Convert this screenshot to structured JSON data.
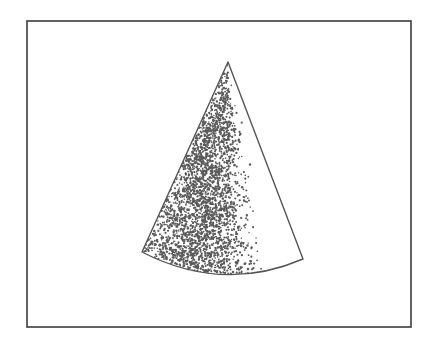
{
  "figure": {
    "canvas": {
      "width": 436,
      "height": 345,
      "background": "#ffffff"
    },
    "caption": "",
    "frame": {
      "name": "figure-border",
      "x": 27,
      "y": 21,
      "width": 384,
      "height": 306,
      "stroke": "#3c3c3c",
      "stroke_width": 1.6,
      "fill": "#ffffff"
    },
    "cone": {
      "name": "stippled-cone",
      "apex": {
        "x": 228,
        "y": 62
      },
      "base_left": {
        "x": 142,
        "y": 252
      },
      "base_right": {
        "x": 303,
        "y": 259
      },
      "base_arc_sag": 19,
      "stroke": "#555555",
      "stroke_width": 1.4,
      "fill": "#ffffff"
    },
    "stipple": {
      "name": "stipple-shading",
      "dot_color": "#5a5a5a",
      "dot_radius_min": 0.7,
      "dot_radius_max": 1.25,
      "count": 2600,
      "density_peak_u": 0.34,
      "density_falloff": 0.22,
      "description": "Dense dot shading concentrated along the left-of-centre band of the cone, fading to blank white toward the right edge."
    }
  },
  "chart_data": {
    "type": "scatter",
    "title": "",
    "subtitle": "",
    "xlabel": "",
    "ylabel": "",
    "xlim": [
      27,
      411
    ],
    "ylim": [
      21,
      327
    ],
    "grid": false,
    "legend": null,
    "annotations": [],
    "series": [
      {
        "name": "cone-outline",
        "kind": "polygon-with-arc-base",
        "points": [
          [
            228,
            62
          ],
          [
            142,
            252
          ],
          [
            303,
            259
          ]
        ],
        "arc_sag": 19
      },
      {
        "name": "stipple-points",
        "kind": "density-shading",
        "values": []
      }
    ]
  }
}
